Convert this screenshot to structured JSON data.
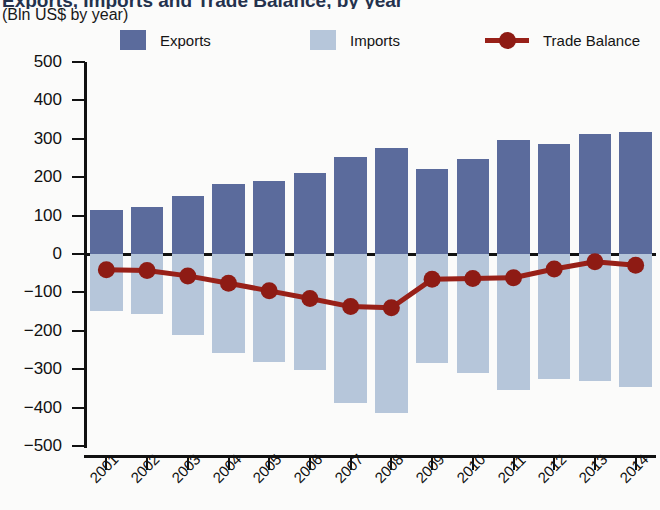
{
  "header": {
    "title_partial": "Exports, Imports and Trade Balance, by year",
    "subtitle": "(Bln US$ by year)"
  },
  "legend": {
    "items": [
      {
        "label": "Exports",
        "marker": "square-swatch",
        "color": "#5b6b9c"
      },
      {
        "label": "Imports",
        "marker": "square-swatch",
        "color": "#b6c6da"
      },
      {
        "label": "Trade Balance",
        "marker": "line-with-dot",
        "color": "#982018"
      }
    ]
  },
  "chart_data": {
    "type": "bar",
    "title": "Exports, Imports and Trade Balance, by year",
    "subtitle": "(Bln US$ by year)",
    "xlabel": "",
    "ylabel": "",
    "ylim": [
      -500,
      500
    ],
    "ytick_labels": [
      "500",
      "400",
      "300",
      "200",
      "100",
      "0",
      "−100",
      "−200",
      "−300",
      "−400",
      "−500"
    ],
    "yticks": [
      500,
      400,
      300,
      200,
      100,
      0,
      -100,
      -200,
      -300,
      -400,
      -500
    ],
    "grid": false,
    "legend_position": "top",
    "categories": [
      "2001",
      "2002",
      "2003",
      "2004",
      "2005",
      "2006",
      "2007",
      "2008",
      "2009",
      "2010",
      "2011",
      "2012",
      "2013",
      "2014"
    ],
    "series": [
      {
        "name": "Exports",
        "type": "bar",
        "color": "#5b6b9c",
        "values": [
          114,
          122,
          152,
          183,
          191,
          212,
          253,
          277,
          221,
          247,
          298,
          287,
          312,
          319
        ]
      },
      {
        "name": "Imports",
        "type": "bar",
        "color": "#b6c6da",
        "values": [
          -148,
          -157,
          -211,
          -258,
          -281,
          -303,
          -387,
          -413,
          -285,
          -311,
          -355,
          -325,
          -332,
          -347
        ]
      },
      {
        "name": "Trade Balance",
        "type": "line",
        "color": "#982018",
        "values": [
          -41,
          -43,
          -57,
          -76,
          -96,
          -116,
          -137,
          -140,
          -66,
          -64,
          -62,
          -39,
          -20,
          -29
        ]
      }
    ]
  },
  "colors": {
    "exports": "#5b6b9c",
    "imports": "#b6c6da",
    "trade_balance": "#982018",
    "axis": "#111111",
    "background": "#fbfbfa"
  }
}
